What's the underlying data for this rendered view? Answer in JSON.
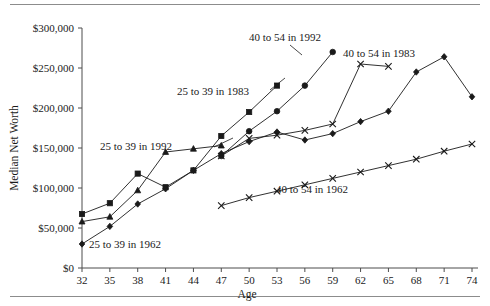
{
  "figure": {
    "name": "median-net-worth-by-age-chart",
    "has_top_rule": true,
    "has_bottom_rule": true
  },
  "chart_data": {
    "type": "line",
    "title": "",
    "xlabel": "Age",
    "ylabel": "Median Net Worth",
    "xlim": [
      32,
      74
    ],
    "ylim": [
      0,
      300000
    ],
    "grid": false,
    "legend_position": "inline-annotations",
    "x_tick_labels": [
      "32",
      "35",
      "38",
      "41",
      "44",
      "47",
      "50",
      "53",
      "56",
      "59",
      "62",
      "65",
      "68",
      "71",
      "74"
    ],
    "x_ticks": [
      32,
      35,
      38,
      41,
      44,
      47,
      50,
      53,
      56,
      59,
      62,
      65,
      68,
      71,
      74
    ],
    "y_tick_labels": [
      "$0",
      "$50,000",
      "$100,000",
      "$150,000",
      "$200,000",
      "$250,000",
      "$300,000"
    ],
    "y_ticks": [
      0,
      50000,
      100000,
      150000,
      200000,
      250000,
      300000
    ],
    "series": [
      {
        "name": "25 to 39 in 1992",
        "marker": "square",
        "x": [
          32,
          35,
          38,
          41,
          44,
          47,
          50,
          53
        ],
        "values": [
          67500,
          81000,
          118000,
          101000,
          122000,
          165000,
          195000,
          228000
        ]
      },
      {
        "name": "25 to 39 in 1983",
        "marker": "triangle",
        "x": [
          32,
          35,
          38,
          41,
          44,
          47
        ],
        "values": [
          58000,
          64000,
          97000,
          145000,
          149000,
          153000
        ]
      },
      {
        "name": "25 to 39 in 1962",
        "marker": "diamond",
        "x": [
          32,
          35,
          38,
          41,
          44,
          47,
          50,
          53,
          56,
          59,
          62,
          65,
          68,
          71,
          74
        ],
        "values": [
          30000,
          52000,
          80000,
          99000,
          122000,
          143000,
          158000,
          170000,
          160000,
          168000,
          183000,
          196000,
          245000,
          264000,
          214000
        ]
      },
      {
        "name": "40 to 54 in 1992",
        "marker": "circle",
        "x": [
          47,
          50,
          53,
          56,
          59
        ],
        "values": [
          140000,
          171000,
          196000,
          228000,
          270000
        ]
      },
      {
        "name": "40 to 54 in 1983",
        "marker": "x",
        "x": [
          47,
          50,
          53,
          56,
          59,
          62,
          65
        ],
        "values": [
          140000,
          162000,
          166000,
          172000,
          180000,
          255000,
          252000
        ]
      },
      {
        "name": "40 to 54 in 1962",
        "marker": "x",
        "x": [
          47,
          50,
          53,
          56,
          59,
          62,
          65,
          68,
          71,
          74
        ],
        "values": [
          78000,
          88000,
          96000,
          104000,
          112000,
          120000,
          128000,
          136000,
          146000,
          155000
        ]
      }
    ],
    "annotations": [
      {
        "text": "25 to 39 in 1992",
        "x": 100,
        "y": 150
      },
      {
        "text": "25 to 39 in 1983",
        "x": 177,
        "y": 95
      },
      {
        "text": "25 to 39 in 1962",
        "x": 89,
        "y": 248
      },
      {
        "text": "40 to 54 in 1992",
        "x": 249,
        "y": 41
      },
      {
        "text": "40 to 54 in 1983",
        "x": 343,
        "y": 57
      },
      {
        "text": "40 to 54 in 1962",
        "x": 276,
        "y": 193
      }
    ]
  }
}
